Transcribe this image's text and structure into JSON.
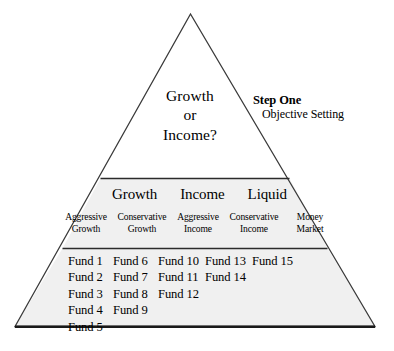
{
  "diagram": {
    "shape": "triangle",
    "fill_color": "#f0f0f0",
    "stroke_color": "#3a3a3a",
    "background_color": "#ffffff"
  },
  "tier_top": {
    "lines": [
      "Growth",
      "or",
      "Income?"
    ]
  },
  "callout": {
    "step_label": "Step One",
    "step_description": "Objective Setting"
  },
  "tier_middle": {
    "categories": [
      "Growth",
      "Income",
      "Liquid"
    ],
    "subcolumns": [
      {
        "line1": "Aggressive",
        "line2": "Growth"
      },
      {
        "line1": "Conservative",
        "line2": "Growth"
      },
      {
        "line1": "Aggressive",
        "line2": "Income"
      },
      {
        "line1": "Conservative",
        "line2": "Income"
      },
      {
        "line1": "Money",
        "line2": "Market"
      }
    ]
  },
  "tier_bottom": {
    "columns": [
      {
        "funds": [
          "Fund 1",
          "Fund 2",
          "Fund 3",
          "Fund 4",
          "Fund 5"
        ]
      },
      {
        "funds": [
          "Fund 6",
          "Fund 7",
          "Fund 8",
          "Fund 9"
        ]
      },
      {
        "funds": [
          "Fund 10",
          "Fund 11",
          "Fund 12"
        ]
      },
      {
        "funds": [
          "Fund 13",
          "Fund 14"
        ]
      },
      {
        "funds": [
          "Fund 15"
        ]
      }
    ]
  }
}
